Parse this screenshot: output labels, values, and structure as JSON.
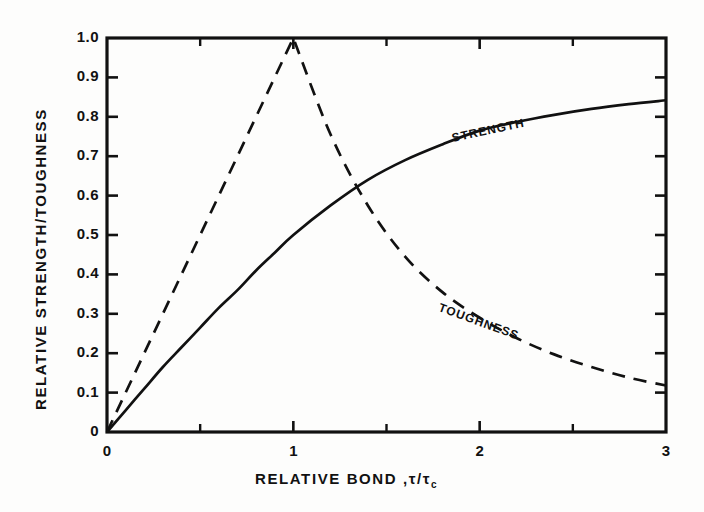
{
  "figure": {
    "background_color": "#fdfdfc",
    "ink_color": "#111111"
  },
  "axes": {
    "y_title": "RELATIVE STRENGTH/TOUGHNESS",
    "x_title_main": "RELATIVE BOND ,",
    "x_title_symbol": "τ/τ",
    "x_title_subscript": "c",
    "y_tick_labels": [
      "1.0",
      "0.9",
      "0.8",
      "0.7",
      "0.6",
      "0.5",
      "0.4",
      "0.3",
      "0.2",
      "0.1",
      "0"
    ],
    "x_tick_labels": [
      "0",
      "1",
      "2",
      "3"
    ]
  },
  "curve_labels": {
    "strength": "STRENGTH",
    "toughness": "TOUGHNESS"
  },
  "chart_data": {
    "type": "line",
    "title": "",
    "xlabel": "RELATIVE BOND, τ/τc",
    "ylabel": "RELATIVE STRENGTH/TOUGHNESS",
    "xlim": [
      0,
      3
    ],
    "ylim": [
      0,
      1.0
    ],
    "xticks": [
      0,
      1,
      2,
      3
    ],
    "xminorticks": [
      0.5,
      1.5,
      2.5
    ],
    "yticks": [
      0,
      0.1,
      0.2,
      0.3,
      0.4,
      0.5,
      0.6,
      0.7,
      0.8,
      0.9,
      1.0
    ],
    "grid": false,
    "legend": "inline-curve-labels",
    "series": [
      {
        "name": "STRENGTH",
        "style": "solid",
        "x": [
          0.0,
          0.1,
          0.2,
          0.3,
          0.4,
          0.5,
          0.6,
          0.7,
          0.8,
          0.9,
          1.0,
          1.2,
          1.4,
          1.6,
          1.8,
          2.0,
          2.2,
          2.4,
          2.6,
          2.8,
          3.0
        ],
        "y": [
          0.0,
          0.055,
          0.11,
          0.165,
          0.215,
          0.265,
          0.315,
          0.36,
          0.41,
          0.455,
          0.5,
          0.575,
          0.64,
          0.69,
          0.73,
          0.765,
          0.787,
          0.805,
          0.82,
          0.832,
          0.842
        ]
      },
      {
        "name": "TOUGHNESS",
        "style": "dashed",
        "x": [
          0.0,
          0.25,
          0.5,
          0.75,
          1.0,
          1.2,
          1.4,
          1.6,
          1.8,
          2.0,
          2.2,
          2.4,
          2.6,
          2.8,
          3.0
        ],
        "y": [
          0.0,
          0.25,
          0.5,
          0.75,
          1.0,
          0.755,
          0.575,
          0.445,
          0.355,
          0.29,
          0.238,
          0.197,
          0.165,
          0.138,
          0.118
        ]
      }
    ],
    "annotations": [
      {
        "text": "STRENGTH",
        "x": 1.85,
        "y": 0.745,
        "rotation_deg": -12
      },
      {
        "text": "TOUGHNESS",
        "x": 1.78,
        "y": 0.318,
        "rotation_deg": 20
      }
    ]
  }
}
